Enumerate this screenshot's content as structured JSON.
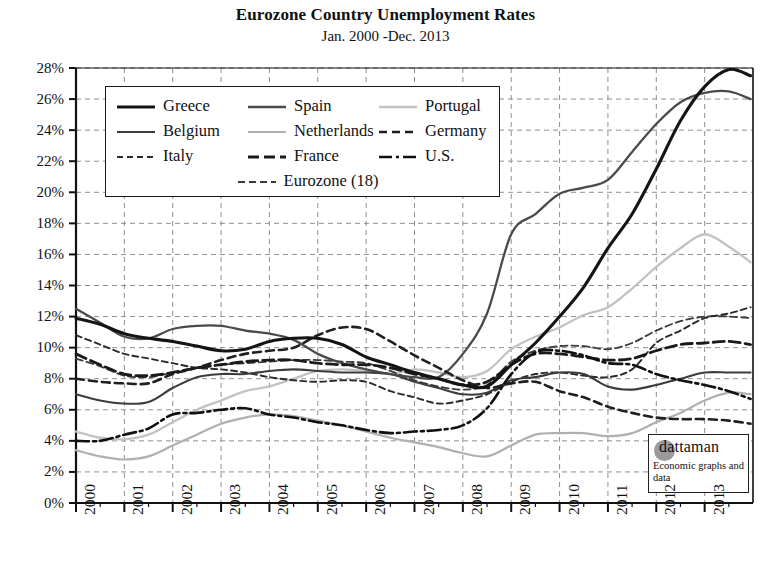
{
  "header": {
    "title": "Eurozone Country Unemployment Rates",
    "subtitle": "Jan. 2000 -Dec. 2013"
  },
  "watermark": {
    "name": "dattaman",
    "tagline": "Economic graphs and data",
    "circle_color": "#9a9a9a"
  },
  "legend": {
    "rows": [
      [
        {
          "label": "Greece",
          "key": "greece"
        },
        {
          "label": "Spain",
          "key": "spain"
        },
        {
          "label": "Portugal",
          "key": "portugal"
        }
      ],
      [
        {
          "label": "Belgium",
          "key": "belgium"
        },
        {
          "label": "Netherlands",
          "key": "netherlands"
        },
        {
          "label": "Germany",
          "key": "germany"
        }
      ],
      [
        {
          "label": "Italy",
          "key": "italy"
        },
        {
          "label": "France",
          "key": "france"
        },
        {
          "label": "U.S.",
          "key": "us"
        }
      ],
      [
        {
          "label": "Eurozone (18)",
          "key": "eurozone"
        }
      ]
    ]
  },
  "chart_data": {
    "type": "line",
    "title": "Eurozone Country Unemployment Rates",
    "subtitle": "Jan. 2000 -Dec. 2013",
    "xlabel": "",
    "ylabel": "",
    "xlim": [
      2000,
      2014
    ],
    "ylim": [
      0,
      28
    ],
    "ytick_step": 2,
    "grid": true,
    "grid_style": "dashed",
    "grid_color": "#8e8e8e",
    "legend_position": "upper-left-inside",
    "x_tick_labels": [
      "2000",
      "2001",
      "2002",
      "2003",
      "2004",
      "2005",
      "2006",
      "2007",
      "2008",
      "2009",
      "2010",
      "2011",
      "2012",
      "2013"
    ],
    "y_tick_labels": [
      "0%",
      "2%",
      "4%",
      "6%",
      "8%",
      "10%",
      "12%",
      "14%",
      "16%",
      "18%",
      "20%",
      "22%",
      "24%",
      "26%",
      "28%"
    ],
    "x": [
      2000.0,
      2000.5,
      2001.0,
      2001.5,
      2002.0,
      2002.5,
      2003.0,
      2003.5,
      2004.0,
      2004.5,
      2005.0,
      2005.5,
      2006.0,
      2006.5,
      2007.0,
      2007.5,
      2008.0,
      2008.5,
      2009.0,
      2009.5,
      2010.0,
      2010.5,
      2011.0,
      2011.5,
      2012.0,
      2012.5,
      2013.0,
      2013.5,
      2013.95
    ],
    "series": [
      {
        "name": "Greece",
        "key": "greece",
        "color": "#141414",
        "width": 3.1,
        "dash": "none",
        "values": [
          11.9,
          11.5,
          10.9,
          10.6,
          10.4,
          10.1,
          9.8,
          9.9,
          10.4,
          10.6,
          10.6,
          10.2,
          9.4,
          8.9,
          8.4,
          8.0,
          7.6,
          7.5,
          8.9,
          10.3,
          12.0,
          13.9,
          16.4,
          18.6,
          21.5,
          24.6,
          26.8,
          27.9,
          27.5
        ]
      },
      {
        "name": "Spain",
        "key": "spain",
        "color": "#4a4a4a",
        "width": 2.3,
        "dash": "none",
        "values": [
          12.5,
          11.6,
          10.7,
          10.6,
          11.2,
          11.4,
          11.4,
          11.1,
          10.9,
          10.5,
          9.6,
          9.0,
          8.6,
          8.3,
          8.1,
          8.1,
          9.6,
          12.2,
          17.3,
          18.6,
          19.9,
          20.3,
          20.8,
          22.6,
          24.4,
          25.8,
          26.4,
          26.5,
          26.0
        ]
      },
      {
        "name": "Portugal",
        "key": "portugal",
        "color": "#c2c2c2",
        "width": 2.3,
        "dash": "none",
        "values": [
          4.6,
          4.2,
          4.1,
          4.4,
          5.2,
          6.0,
          6.6,
          7.2,
          7.5,
          8.0,
          8.5,
          8.6,
          8.5,
          8.3,
          8.6,
          8.4,
          8.1,
          8.5,
          9.9,
          10.7,
          11.3,
          12.1,
          12.6,
          13.8,
          15.2,
          16.4,
          17.3,
          16.5,
          15.5
        ]
      },
      {
        "name": "Belgium",
        "key": "belgium",
        "color": "#3c3c3c",
        "width": 2.1,
        "dash": "none",
        "values": [
          7.0,
          6.6,
          6.4,
          6.5,
          7.4,
          8.1,
          8.3,
          8.3,
          8.5,
          8.6,
          8.5,
          8.4,
          8.4,
          8.3,
          7.8,
          7.4,
          7.0,
          7.1,
          7.9,
          8.1,
          8.4,
          8.3,
          7.5,
          7.3,
          7.6,
          8.0,
          8.4,
          8.4,
          8.4
        ]
      },
      {
        "name": "Netherlands",
        "key": "netherlands",
        "color": "#b0b0b0",
        "width": 2.2,
        "dash": "none",
        "values": [
          3.4,
          3.0,
          2.8,
          3.0,
          3.7,
          4.4,
          5.1,
          5.5,
          5.7,
          5.6,
          5.3,
          5.0,
          4.6,
          4.2,
          3.9,
          3.6,
          3.2,
          3.0,
          3.7,
          4.4,
          4.5,
          4.5,
          4.3,
          4.5,
          5.2,
          5.8,
          6.6,
          7.1,
          7.0
        ]
      },
      {
        "name": "Germany",
        "key": "germany",
        "color": "#1f1f1f",
        "width": 2.6,
        "dash": "8,5",
        "values": [
          8.0,
          7.8,
          7.7,
          7.7,
          8.3,
          8.7,
          9.2,
          9.6,
          9.8,
          10.0,
          10.8,
          11.3,
          11.2,
          10.4,
          9.5,
          8.7,
          7.9,
          7.4,
          7.7,
          7.8,
          7.2,
          6.8,
          6.2,
          5.8,
          5.5,
          5.4,
          5.4,
          5.3,
          5.1
        ]
      },
      {
        "name": "Italy",
        "key": "italy",
        "color": "#2a2a2a",
        "width": 1.9,
        "dash": "6,4",
        "values": [
          10.8,
          10.2,
          9.6,
          9.3,
          9.0,
          8.7,
          8.6,
          8.4,
          8.1,
          7.9,
          7.8,
          7.9,
          7.8,
          7.2,
          6.8,
          6.4,
          6.6,
          7.0,
          7.8,
          8.3,
          8.4,
          8.2,
          8.1,
          8.6,
          10.3,
          11.1,
          11.9,
          12.2,
          12.6
        ]
      },
      {
        "name": "France",
        "key": "france",
        "color": "#1a1a1a",
        "width": 2.8,
        "dash": "11,5",
        "values": [
          9.6,
          8.9,
          8.3,
          8.2,
          8.4,
          8.7,
          8.9,
          9.1,
          9.2,
          9.2,
          9.0,
          8.9,
          8.9,
          8.7,
          8.3,
          8.0,
          7.6,
          7.8,
          8.9,
          9.6,
          9.6,
          9.4,
          9.2,
          9.3,
          9.8,
          10.2,
          10.3,
          10.4,
          10.2
        ]
      },
      {
        "name": "U.S.",
        "key": "us",
        "color": "#101010",
        "width": 2.6,
        "dash": "13,4,3,4",
        "values": [
          4.0,
          4.0,
          4.4,
          4.8,
          5.7,
          5.8,
          6.0,
          6.1,
          5.7,
          5.5,
          5.2,
          5.0,
          4.7,
          4.5,
          4.6,
          4.7,
          5.0,
          6.1,
          8.3,
          9.7,
          9.8,
          9.5,
          9.0,
          8.9,
          8.3,
          7.9,
          7.6,
          7.2,
          6.7
        ]
      },
      {
        "name": "Eurozone (18)",
        "key": "eurozone",
        "color": "#3a3a3a",
        "width": 1.8,
        "dash": "7,4",
        "values": [
          9.3,
          8.8,
          8.2,
          8.1,
          8.4,
          8.7,
          8.9,
          9.0,
          9.1,
          9.2,
          9.2,
          9.1,
          9.0,
          8.5,
          7.9,
          7.5,
          7.3,
          7.6,
          9.1,
          9.8,
          10.1,
          10.1,
          9.9,
          10.3,
          11.1,
          11.7,
          12.0,
          12.0,
          11.9
        ]
      }
    ]
  }
}
